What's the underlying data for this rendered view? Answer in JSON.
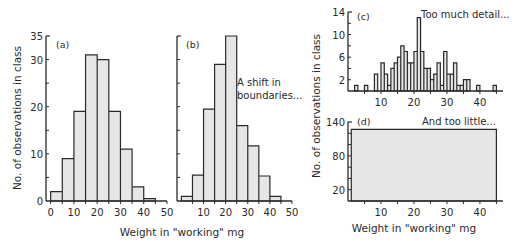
{
  "chart_data": [
    {
      "type": "bar",
      "panel": "(a)",
      "title": "",
      "xlabel": "Weight in \"working\" mg",
      "ylabel": "No. of observations in class",
      "bin_edges": [
        0,
        5,
        10,
        15,
        20,
        25,
        30,
        35,
        40,
        45
      ],
      "values": [
        2,
        9,
        19,
        31,
        30,
        19,
        11,
        3,
        0.5
      ],
      "xticks": [
        0,
        10,
        20,
        30,
        40,
        50
      ],
      "yticks": [
        0,
        10,
        20,
        30,
        35
      ],
      "xlim": [
        0,
        50
      ],
      "ylim": [
        0,
        35
      ],
      "grid": false
    },
    {
      "type": "bar",
      "panel": "(b)",
      "annotation": "A shift in boundaries...",
      "bin_edges": [
        0,
        5,
        10,
        15,
        20,
        25,
        30,
        35,
        40,
        45
      ],
      "values": [
        1,
        5.5,
        19.5,
        29,
        35,
        16,
        11.7,
        5.3,
        1
      ],
      "xticks": [
        10,
        20,
        30,
        40,
        50
      ],
      "xlim": [
        0,
        50
      ],
      "ylim": [
        0,
        35
      ],
      "grid": false
    },
    {
      "type": "bar",
      "panel": "(c)",
      "annotation": "Too much detail...",
      "bin_width": 1,
      "bins_start": [
        2,
        5,
        8,
        10,
        11,
        12,
        13,
        14,
        15,
        16,
        17,
        18,
        19,
        20,
        21,
        22,
        23,
        24,
        25,
        26,
        27,
        28,
        29,
        30,
        31,
        32,
        33,
        34,
        35,
        36,
        39,
        44
      ],
      "values": [
        1,
        1,
        3,
        5,
        3,
        1,
        4,
        5,
        6,
        8,
        7,
        5,
        5,
        7,
        13,
        7,
        4,
        4,
        2,
        3,
        5,
        1,
        7,
        3,
        3,
        5,
        1,
        1,
        2,
        2,
        1,
        1
      ],
      "xticks": [
        10,
        20,
        30,
        40
      ],
      "yticks": [
        2,
        6,
        10,
        14
      ],
      "xlim": [
        0,
        47
      ],
      "ylim": [
        0,
        14
      ],
      "ylabel": "No. of observations in class",
      "grid": false
    },
    {
      "type": "bar",
      "panel": "(d)",
      "annotation": "And too little...",
      "bin_edges": [
        1,
        45
      ],
      "values": [
        127
      ],
      "xticks": [
        10,
        20,
        30,
        40
      ],
      "yticks": [
        20,
        80,
        140
      ],
      "xlim": [
        0,
        47
      ],
      "ylim": [
        0,
        140
      ],
      "xlabel": "Weight in \"working\" mg",
      "grid": false
    }
  ],
  "labels": {
    "panel_a": "(a)",
    "panel_b": "(b)",
    "panel_c": "(c)",
    "panel_d": "(d)",
    "annot_b_line1": "A shift in",
    "annot_b_line2": "boundaries...",
    "annot_c": "Too much detail...",
    "annot_d": "And too little...",
    "xlabel_left": "Weight in \"working\" mg",
    "xlabel_right": "Weight in \"working\" mg",
    "ylabel_left": "No. of observations in class",
    "ylabel_right": "No. of observations in class",
    "a_yticks": [
      "0",
      "10",
      "20",
      "30",
      "35"
    ],
    "a_xticks": [
      "0",
      "10",
      "20",
      "30",
      "40",
      "50"
    ],
    "b_xticks": [
      "10",
      "20",
      "30",
      "40",
      "50"
    ],
    "c_yticks": [
      "2",
      "6",
      "10",
      "14"
    ],
    "c_xticks": [
      "10",
      "20",
      "30",
      "40"
    ],
    "d_yticks": [
      "20",
      "80",
      "140"
    ],
    "d_xticks": [
      "10",
      "20",
      "30",
      "40"
    ]
  },
  "colors": {
    "fill": "#e6e6e6",
    "stroke": "#2a2a2a"
  }
}
